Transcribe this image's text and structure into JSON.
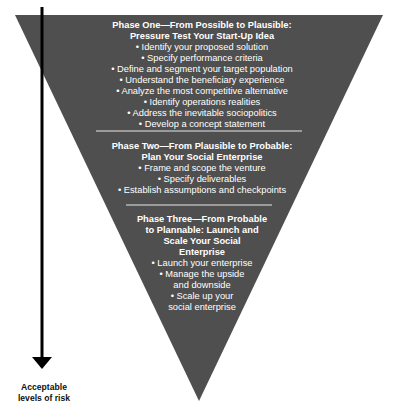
{
  "colors": {
    "funnel_fill": "#4f4f4f",
    "text": "#ffffff",
    "divider": "#e6e6e6",
    "arrow": "#000000"
  },
  "phases": [
    {
      "title_lines": [
        "Phase One—From Possible to Plausible:",
        "Pressure Test Your Start-Up Idea"
      ],
      "items": [
        "• Identify your proposed solution",
        "• Specify performance criteria",
        "• Define and segment your target population",
        "• Understand the beneficiary experience",
        "• Analyze the most competitive alternative",
        "• Identify operations realities",
        "• Address the inevitable sociopolitics",
        "• Develop a concept statement"
      ]
    },
    {
      "title_lines": [
        "Phase Two—From Plausible to Probable:",
        "Plan Your Social Enterprise"
      ],
      "items": [
        "• Frame and scope the venture",
        "• Specify deliverables",
        "• Establish assumptions and checkpoints"
      ]
    },
    {
      "title_lines": [
        "Phase Three—From Probable",
        "to Plannable: Launch and",
        "Scale Your Social",
        "Enterprise"
      ],
      "items": [
        "• Launch your enterprise",
        "• Manage the upside",
        "and downside",
        "• Scale up your",
        "social enterprise"
      ]
    }
  ],
  "arrow_label_lines": [
    "Acceptable",
    "levels of risk"
  ]
}
